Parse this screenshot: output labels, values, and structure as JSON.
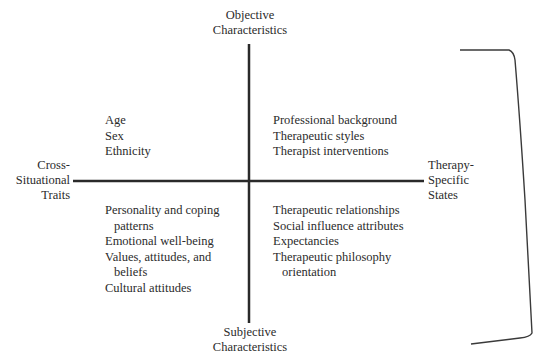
{
  "axes": {
    "top_label": [
      "Objective",
      "Characteristics"
    ],
    "bottom_label": [
      "Subjective",
      "Characteristics"
    ],
    "left_label": [
      "Cross-",
      "Situational",
      "Traits"
    ],
    "right_label": [
      "Therapy-",
      "Specific",
      "States"
    ]
  },
  "quadrants": {
    "top_left": {
      "items": [
        {
          "text": "Age"
        },
        {
          "text": "Sex"
        },
        {
          "text": "Ethnicity"
        }
      ]
    },
    "top_right": {
      "items": [
        {
          "text": "Professional background"
        },
        {
          "text": "Therapeutic styles"
        },
        {
          "text": "Therapist interventions"
        }
      ]
    },
    "bottom_left": {
      "items": [
        {
          "text": "Personality and coping",
          "cont": "patterns"
        },
        {
          "text": "Emotional well-being"
        },
        {
          "text": "Values, attitudes, and",
          "cont": "beliefs"
        },
        {
          "text": "Cultural attitudes"
        }
      ]
    },
    "bottom_right": {
      "items": [
        {
          "text": "Therapeutic relationships"
        },
        {
          "text": "Social influence attributes"
        },
        {
          "text": "Expectancies"
        },
        {
          "text": "Therapeutic philosophy",
          "cont": "orientation"
        }
      ]
    }
  },
  "colors": {
    "line": "#2a2a2a",
    "text": "#2b2b2b",
    "background": "#ffffff"
  }
}
